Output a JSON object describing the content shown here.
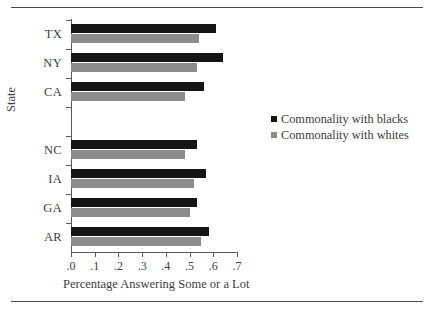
{
  "figure": {
    "y_axis_title": "State",
    "x_axis_title": "Percentage Answering Some or a Lot"
  },
  "legend": {
    "items": [
      {
        "label": "Commonality with blacks",
        "color": "#151515"
      },
      {
        "label": "Commonality with whites",
        "color": "#8c8c8c"
      }
    ]
  },
  "chart_data": {
    "type": "bar",
    "orientation": "horizontal",
    "title": "",
    "xlabel": "Percentage Answering Some or a Lot",
    "ylabel": "State",
    "xlim": [
      0.0,
      0.7
    ],
    "grid": false,
    "legend_position": "right",
    "xticks": [
      0.0,
      0.1,
      0.2,
      0.3,
      0.4,
      0.5,
      0.6,
      0.7
    ],
    "xticklabels": [
      ".0",
      ".1",
      ".2",
      ".3",
      ".4",
      ".5",
      ".6",
      ".7"
    ],
    "categories": [
      "TX",
      "NY",
      "CA",
      "",
      "NC",
      "IA",
      "GA",
      "AR"
    ],
    "series": [
      {
        "name": "Commonality with blacks",
        "color": "#151515",
        "values": [
          0.61,
          0.64,
          0.56,
          null,
          0.53,
          0.57,
          0.53,
          0.58
        ]
      },
      {
        "name": "Commonality with whites",
        "color": "#8c8c8c",
        "values": [
          0.54,
          0.53,
          0.48,
          null,
          0.48,
          0.52,
          0.5,
          0.55
        ]
      }
    ]
  }
}
